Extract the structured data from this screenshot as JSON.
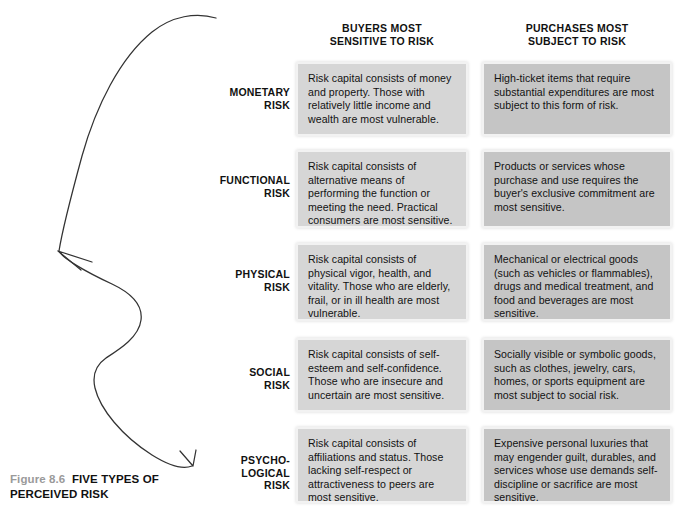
{
  "figure": {
    "number": "Figure 8.6",
    "title": "FIVE TYPES OF PERCEIVED RISK"
  },
  "columns": {
    "left": {
      "line1": "BUYERS MOST",
      "line2": "SENSITIVE TO RISK"
    },
    "right": {
      "line1": "PURCHASES MOST",
      "line2": "SUBJECT TO RISK"
    }
  },
  "rows": [
    {
      "label_line1": "MONETARY",
      "label_line2": "RISK",
      "label_line3": "",
      "buyers": "Risk capital consists of money and property. Those with relatively little income and wealth are most vulnerable.",
      "purchases": "High-ticket items that require substantial expenditures are most subject to this form of risk."
    },
    {
      "label_line1": "FUNCTIONAL",
      "label_line2": "RISK",
      "label_line3": "",
      "buyers": "Risk capital consists of alternative means of performing the function or meeting the need. Practical consumers are most sensitive.",
      "purchases": "Products or services whose purchase and use requires the buyer's exclusive commitment are most sensitive."
    },
    {
      "label_line1": "PHYSICAL",
      "label_line2": "RISK",
      "label_line3": "",
      "buyers": "Risk capital consists of physical vigor, health, and vitality. Those who are elderly, frail, or in ill health are most vulnerable.",
      "purchases": "Mechanical or electrical goods (such as vehicles or flammables), drugs and medical treatment, and food and beverages are most sensitive."
    },
    {
      "label_line1": "SOCIAL",
      "label_line2": "RISK",
      "label_line3": "",
      "buyers": "Risk capital consists of self-esteem and self-confidence. Those who are insecure and uncertain are most sensitive.",
      "purchases": "Socially visible or symbolic goods, such as clothes, jewelry, cars, homes, or sports equipment are most subject to social risk."
    },
    {
      "label_line1": "PSYCHO-",
      "label_line2": "LOGICAL",
      "label_line3": "RISK",
      "buyers": "Risk capital consists of affiliations and status. Those lacking self-respect or attractiveness to peers are most sensitive.",
      "purchases": "Expensive personal luxuries that may engender guilt, durables, and services whose use demands self-discipline or sacrifice are most sensitive."
    }
  ],
  "colors": {
    "cell_left_fill": "#d6d6d6",
    "cell_right_fill": "#c5c5c5",
    "cell_border": "#f2f2f2",
    "text": "#111111",
    "caption_number": "#9a9a9a",
    "arrow_stroke": "#333333"
  }
}
